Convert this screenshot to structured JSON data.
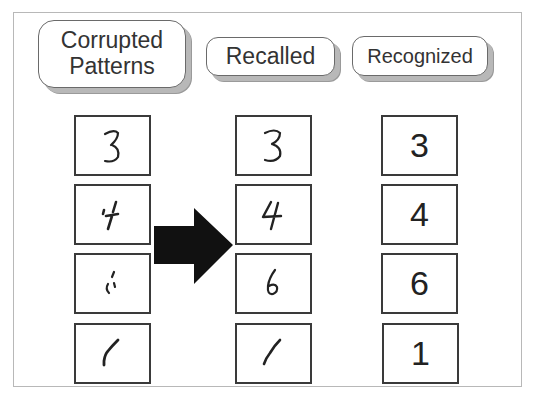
{
  "headers": {
    "corrupted": [
      "Corrupted",
      "Patterns"
    ],
    "recalled": "Recalled",
    "recognized": "Recognized"
  },
  "columns": {
    "corrupted": [
      "3",
      "4",
      "6",
      "1"
    ],
    "recalled": [
      "3",
      "4",
      "6",
      "1"
    ],
    "recognized": [
      "3",
      "4",
      "6",
      "1"
    ]
  },
  "arrow": {
    "direction": "right",
    "color": "#111111"
  },
  "colors": {
    "frame": "#b8b8b8",
    "box_border": "#3a3a3a",
    "ink": "#222222",
    "shadow": "#b8b8b8"
  }
}
